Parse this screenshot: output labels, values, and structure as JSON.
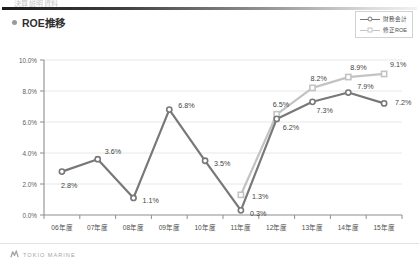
{
  "header": {
    "slide_text": "決算説明資料",
    "rule": true
  },
  "title": {
    "bullet": "bullet-icon",
    "text": "ROE推移"
  },
  "legend": {
    "position": "top-right",
    "items": [
      {
        "label": "財務会計",
        "color": "#787878",
        "marker": "circle"
      },
      {
        "label": "修正ROE",
        "color": "#c3c3c3",
        "marker": "square"
      }
    ]
  },
  "footer": {
    "logo_mark": "tokio-marine-logo-icon",
    "logo_text": "TOKIO MARINE"
  },
  "chart_data": {
    "type": "line",
    "title": "ROE推移",
    "xlabel": "",
    "ylabel": "",
    "ylim": [
      0,
      10
    ],
    "ytick_values": [
      0,
      2,
      4,
      6,
      8,
      10
    ],
    "ytick_labels": [
      "0.0%",
      "2.0%",
      "4.0%",
      "6.0%",
      "8.0%",
      "10.0%"
    ],
    "grid": true,
    "legend_position": "top-right",
    "categories": [
      "06年度",
      "07年度",
      "08年度",
      "09年度",
      "10年度",
      "11年度",
      "12年度",
      "13年度",
      "14年度",
      "15年度"
    ],
    "series": [
      {
        "name": "財務会計",
        "color": "#787878",
        "marker": "circle",
        "values": [
          2.8,
          3.6,
          1.1,
          6.8,
          3.5,
          0.3,
          6.2,
          7.3,
          7.9,
          7.2
        ],
        "labels": [
          "2.8%",
          "3.6%",
          "1.1%",
          "6.8%",
          "3.5%",
          "0.3%",
          "6.2%",
          "7.3%",
          "7.9%",
          "7.2%"
        ]
      },
      {
        "name": "修正ROE",
        "color": "#c3c3c3",
        "marker": "square",
        "values": [
          null,
          null,
          null,
          null,
          null,
          1.3,
          6.5,
          8.2,
          8.9,
          9.1
        ],
        "labels": [
          null,
          null,
          null,
          null,
          null,
          "1.3%",
          "6.5%",
          "8.2%",
          "8.9%",
          "9.1%"
        ]
      }
    ]
  }
}
